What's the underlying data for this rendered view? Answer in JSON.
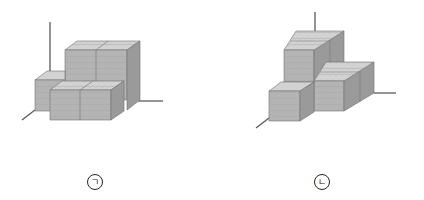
{
  "figures": [
    {
      "id": "figure-a",
      "label": "ㄱ",
      "description": "Stacked wooden cubes on 3D axes: back raised row of 2, front row of 2, left single cube"
    },
    {
      "id": "figure-b",
      "label": "ㄴ",
      "description": "Stepped stack of wooden cubes on 3D axes"
    }
  ],
  "colors": {
    "front_face": "#b4b4b4",
    "top_face": "#d2d2d2",
    "side_face": "#9a9a9a",
    "edge": "#6e6e6e",
    "axis": "#5a5a5a"
  }
}
